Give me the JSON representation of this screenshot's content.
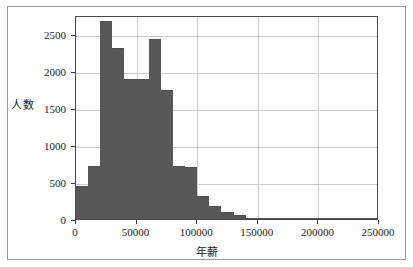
{
  "chart_data": {
    "type": "bar",
    "title": "",
    "subtitle": "",
    "xlabel": "年薪",
    "ylabel": "人数",
    "xlim": [
      0,
      250000
    ],
    "ylim": [
      0,
      2750
    ],
    "grid": true,
    "legend": null,
    "bin_width": 10000,
    "x_ticks": [
      {
        "value": 0,
        "label": "0"
      },
      {
        "value": 50000,
        "label": "50000"
      },
      {
        "value": 100000,
        "label": "100000"
      },
      {
        "value": 150000,
        "label": "150000"
      },
      {
        "value": 200000,
        "label": "200000"
      },
      {
        "value": 250000,
        "label": "250000"
      }
    ],
    "y_ticks": [
      {
        "value": 0,
        "label": "0"
      },
      {
        "value": 500,
        "label": "500"
      },
      {
        "value": 1000,
        "label": "1000"
      },
      {
        "value": 1500,
        "label": "1500"
      },
      {
        "value": 2000,
        "label": "2000"
      },
      {
        "value": 2500,
        "label": "2500"
      }
    ],
    "bars": [
      {
        "x0": 0,
        "x1": 10000,
        "value": 440
      },
      {
        "x0": 10000,
        "x1": 20000,
        "value": 720
      },
      {
        "x0": 20000,
        "x1": 30000,
        "value": 2670
      },
      {
        "x0": 30000,
        "x1": 40000,
        "value": 2310
      },
      {
        "x0": 40000,
        "x1": 50000,
        "value": 1890
      },
      {
        "x0": 50000,
        "x1": 60000,
        "value": 1890
      },
      {
        "x0": 60000,
        "x1": 70000,
        "value": 2420
      },
      {
        "x0": 70000,
        "x1": 80000,
        "value": 1740
      },
      {
        "x0": 80000,
        "x1": 90000,
        "value": 720
      },
      {
        "x0": 90000,
        "x1": 100000,
        "value": 700
      },
      {
        "x0": 100000,
        "x1": 110000,
        "value": 310
      },
      {
        "x0": 110000,
        "x1": 120000,
        "value": 175
      },
      {
        "x0": 120000,
        "x1": 130000,
        "value": 100
      },
      {
        "x0": 130000,
        "x1": 140000,
        "value": 48
      },
      {
        "x0": 140000,
        "x1": 150000,
        "value": 14
      },
      {
        "x0": 150000,
        "x1": 160000,
        "value": 8
      },
      {
        "x0": 160000,
        "x1": 170000,
        "value": 6
      },
      {
        "x0": 170000,
        "x1": 180000,
        "value": 5
      },
      {
        "x0": 180000,
        "x1": 190000,
        "value": 4
      },
      {
        "x0": 190000,
        "x1": 200000,
        "value": 2
      },
      {
        "x0": 200000,
        "x1": 210000,
        "value": 1
      },
      {
        "x0": 210000,
        "x1": 220000,
        "value": 1
      },
      {
        "x0": 220000,
        "x1": 230000,
        "value": 1
      },
      {
        "x0": 230000,
        "x1": 240000,
        "value": 1
      },
      {
        "x0": 240000,
        "x1": 250000,
        "value": 1
      }
    ],
    "colors": {
      "bar_fill": "#575757",
      "grid": "#c9c9c9",
      "axis": "#4a4a4a",
      "text": "#1a1a1a",
      "background": "#ffffff",
      "outer_frame": "#9a9a9a"
    }
  }
}
